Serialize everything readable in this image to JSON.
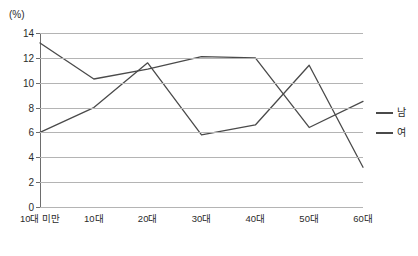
{
  "chart_data": {
    "type": "line",
    "title": "",
    "subtitle": "",
    "xlabel": "",
    "ylabel": "(%)",
    "unit_caption": "(%)",
    "categories": [
      "10대 미만",
      "10대",
      "20대",
      "30대",
      "40대",
      "50대",
      "60대"
    ],
    "yticks": [
      0,
      2,
      4,
      6,
      8,
      10,
      12,
      14
    ],
    "ylim": [
      0,
      14
    ],
    "grid": true,
    "legend_position": "right",
    "series": [
      {
        "name": "남",
        "color": "#4a4a4a",
        "values": [
          13.2,
          10.3,
          11.1,
          12.1,
          12.0,
          6.4,
          8.5
        ]
      },
      {
        "name": "여",
        "color": "#4a4a4a",
        "values": [
          6.0,
          8.0,
          11.6,
          5.8,
          6.6,
          11.4,
          3.2
        ]
      }
    ]
  },
  "legend": {
    "items": [
      {
        "label": "남"
      },
      {
        "label": "여"
      }
    ]
  },
  "colors": {
    "axis": "#6d6d6d",
    "grid": "#b4b4b4",
    "line": "#4a4a4a",
    "text": "#2b2b2b",
    "background": "#ffffff"
  }
}
